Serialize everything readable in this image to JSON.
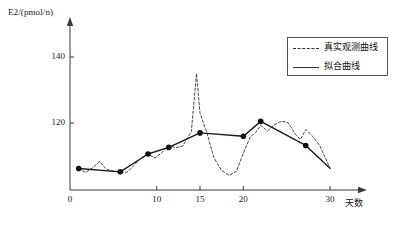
{
  "chart_data": {
    "type": "line",
    "title": "",
    "xlabel": "天数",
    "ylabel": "E2/(pmol/n)",
    "xlim": [
      0,
      32
    ],
    "ylim": [
      96,
      146
    ],
    "grid": false,
    "legend_position": "top-right",
    "x_ticks": [
      {
        "value": 0,
        "label": "0"
      },
      {
        "value": 10,
        "label": "10"
      },
      {
        "value": 15,
        "label": "15"
      },
      {
        "value": 20,
        "label": "20"
      },
      {
        "value": 30,
        "label": "30"
      }
    ],
    "y_ticks": [
      {
        "value": 120,
        "label": "120"
      },
      {
        "value": 140,
        "label": "140"
      }
    ],
    "series": [
      {
        "name": "真实观测曲线",
        "style": "dashed",
        "color": "#333333",
        "markers": false,
        "x": [
          1,
          1.8,
          2.6,
          3.4,
          4.2,
          5.0,
          5.8,
          6.6,
          7.4,
          8.2,
          9.0,
          9.8,
          10.6,
          11.4,
          12.2,
          13.0,
          14.0,
          14.6,
          15.0,
          15.8,
          16.6,
          17.5,
          18.4,
          19.2,
          20.0,
          20.8,
          21.4,
          22.0,
          22.8,
          23.6,
          24.4,
          25.2,
          26.0,
          26.6,
          27.2,
          28.0,
          28.8,
          30.0
        ],
        "y": [
          106.2,
          105.0,
          106.4,
          108.3,
          106.0,
          105.4,
          105.2,
          105.1,
          107.2,
          109.4,
          110.6,
          109.4,
          111.0,
          113.2,
          112.5,
          113.0,
          117.4,
          135.0,
          123.0,
          117.0,
          109.5,
          105.6,
          104.1,
          105.4,
          110.8,
          115.8,
          117.0,
          119.3,
          117.6,
          119.5,
          120.6,
          120.0,
          116.6,
          115.0,
          118.0,
          116.0,
          113.2,
          106.3
        ]
      },
      {
        "name": "拟合曲线",
        "style": "solid",
        "color": "#1a1a1a",
        "markers": true,
        "x": [
          1.0,
          5.8,
          9.0,
          11.4,
          15.0,
          20.0,
          22.0,
          27.2,
          30.0
        ],
        "y": [
          106.2,
          105.2,
          110.6,
          112.6,
          117.0,
          116.0,
          120.5,
          113.2,
          106.3
        ]
      }
    ]
  },
  "legend": {
    "entries": [
      {
        "label": "真实观测曲线",
        "style": "dashed"
      },
      {
        "label": "拟合曲线",
        "style": "solid"
      }
    ]
  }
}
